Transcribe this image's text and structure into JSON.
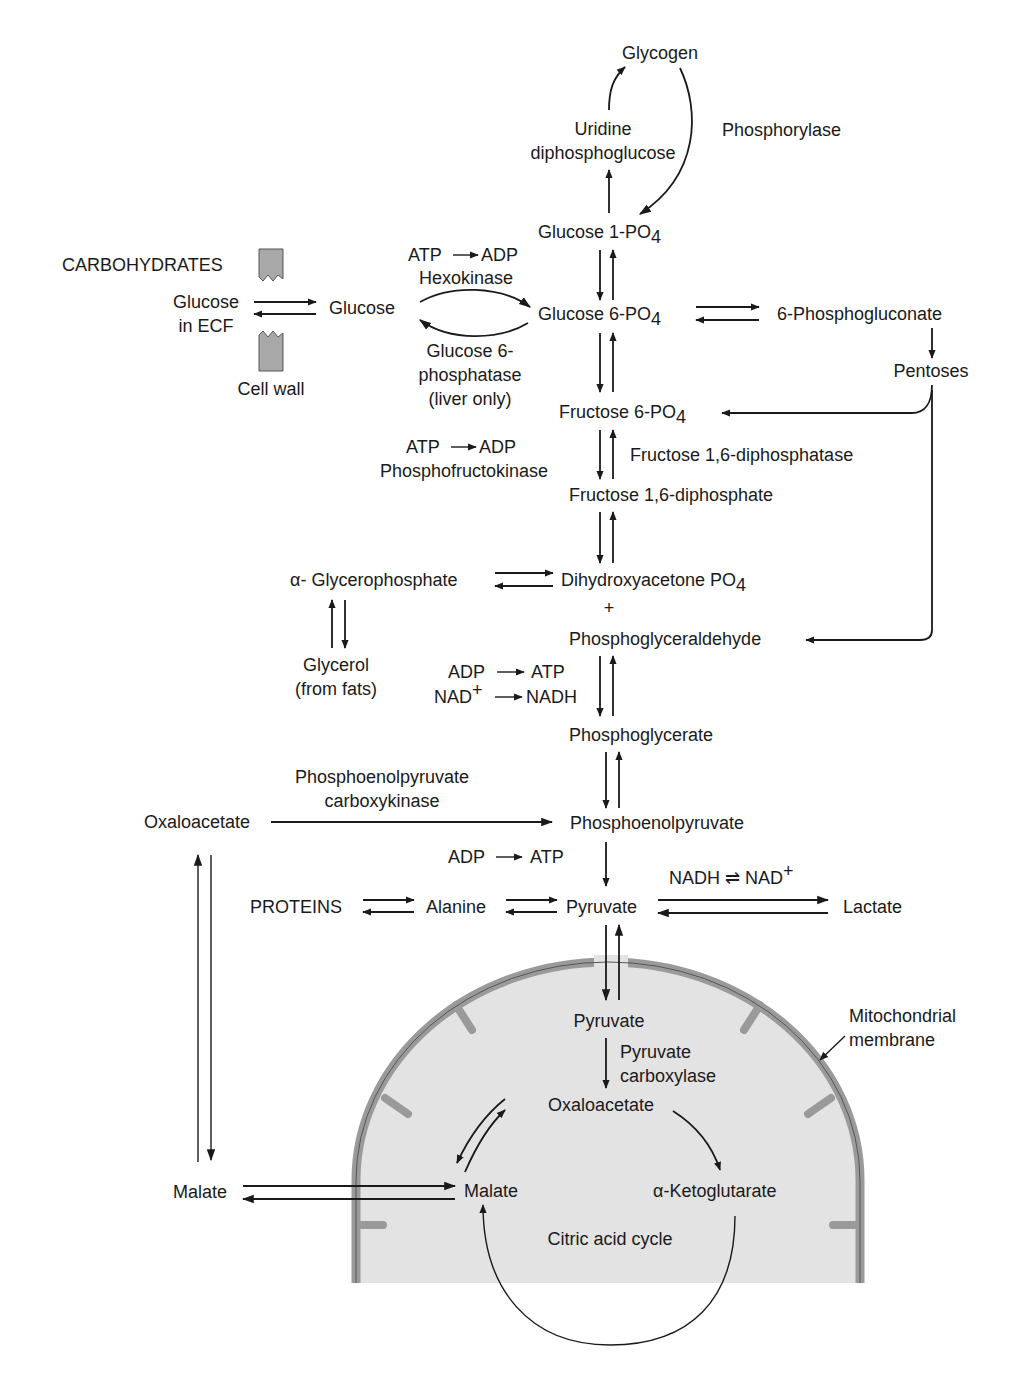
{
  "figure": {
    "colors": {
      "ink": "#1a1a1a",
      "mitochondrion_fill": "#e3e3e3",
      "membrane": "#9a9a9a",
      "cell_wall_block": "#a8a8a8"
    }
  },
  "labels": {
    "glycogen": "Glycogen",
    "udpg_1": "Uridine",
    "udpg_2": "diphosphoglucose",
    "phosphorylase": "Phosphorylase",
    "glucose1po4": "Glucose 1-PO",
    "glucose1po4_sub": "4",
    "carbohydrates": "CARBOHYDRATES",
    "glucose_ecf_1": "Glucose",
    "glucose_ecf_2": "in ECF",
    "cell_wall": "Cell wall",
    "glucose": "Glucose",
    "hexokinase_atp": "ATP",
    "hexokinase_adp": "ADP",
    "hexokinase": "Hexokinase",
    "g6pase_1": "Glucose 6-",
    "g6pase_2": "phosphatase",
    "g6pase_3": "(liver only)",
    "glucose6po4": "Glucose 6-PO",
    "glucose6po4_sub": "4",
    "phosphogluconate": "6-Phosphogluconate",
    "pentoses": "Pentoses",
    "fructose6po4": "Fructose 6-PO",
    "fructose6po4_sub": "4",
    "pfk_atp": "ATP",
    "pfk_adp": "ADP",
    "pfk": "Phosphofructokinase",
    "fbpase": "Fructose 1,6-diphosphatase",
    "fructose16dp": "Fructose 1,6-diphosphate",
    "glycerophosphate": "α- Glycerophosphate",
    "dhap": "Dihydroxyacetone PO",
    "dhap_sub": "4",
    "plus": "+",
    "pgald": "Phosphoglyceraldehyde",
    "glycerol_1": "Glycerol",
    "glycerol_2": "(from fats)",
    "gapdh_adp": "ADP",
    "gapdh_atp": "ATP",
    "gapdh_nad": "NAD",
    "gapdh_nad_sup": "+",
    "gapdh_nadh": "NADH",
    "phosphoglycerate": "Phosphoglycerate",
    "pepck_1": "Phosphoenolpyruvate",
    "pepck_2": "carboxykinase",
    "oxaloacetate_cyto": "Oxaloacetate",
    "pep": "Phosphoenolpyruvate",
    "pk_adp": "ADP",
    "pk_atp": "ATP",
    "ldh_cofactor": "NADH ⇌ NAD",
    "ldh_cofactor_sup": "+",
    "proteins": "PROTEINS",
    "alanine": "Alanine",
    "pyruvate_cyto": "Pyruvate",
    "lactate": "Lactate",
    "pyruvate_mito": "Pyruvate",
    "pc_1": "Pyruvate",
    "pc_2": "carboxylase",
    "mito_membrane_1": "Mitochondrial",
    "mito_membrane_2": "membrane",
    "oxaloacetate_mito": "Oxaloacetate",
    "malate_cyto": "Malate",
    "malate_mito": "Malate",
    "akg": "α-Ketoglutarate",
    "tca": "Citric acid cycle"
  }
}
